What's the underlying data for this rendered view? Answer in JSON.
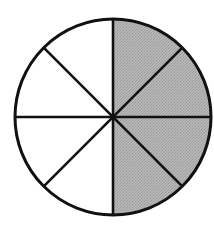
{
  "figure": {
    "title": "Fraction circle divided into eighths",
    "shape_name": "circle",
    "canvas": {
      "width": 214,
      "height": 227,
      "background_color": "#ffffff"
    }
  },
  "chart_data": {
    "type": "pie",
    "title": "",
    "subtitle": "",
    "xlabel": "",
    "ylabel": "",
    "legend_position": "none",
    "grid": false,
    "total_slices": 8,
    "slice_angle_degrees": 45,
    "shaded_slices": 4,
    "unshaded_slices": 4,
    "fraction_shaded": "4/8",
    "fraction_shaded_decimal": 0.5,
    "percent_shaded": 50,
    "categories": [
      "sector-1",
      "sector-2",
      "sector-3",
      "sector-4",
      "sector-5",
      "sector-6",
      "sector-7",
      "sector-8"
    ],
    "values": [
      45,
      45,
      45,
      45,
      45,
      45,
      45,
      45
    ],
    "series": [
      {
        "name": "shading",
        "values": [
          "shaded",
          "shaded",
          "shaded",
          "shaded",
          "unshaded",
          "unshaded",
          "unshaded",
          "unshaded"
        ]
      }
    ],
    "sectors": [
      {
        "id": "sector-1",
        "start_deg": -90,
        "end_deg": -45,
        "shaded": true,
        "position": "upper-right-upper"
      },
      {
        "id": "sector-2",
        "start_deg": -45,
        "end_deg": 0,
        "shaded": true,
        "position": "upper-right-lower"
      },
      {
        "id": "sector-3",
        "start_deg": 0,
        "end_deg": 45,
        "shaded": true,
        "position": "lower-right-upper"
      },
      {
        "id": "sector-4",
        "start_deg": 45,
        "end_deg": 90,
        "shaded": true,
        "position": "lower-right-lower"
      },
      {
        "id": "sector-5",
        "start_deg": 90,
        "end_deg": 135,
        "shaded": false,
        "position": "lower-left-lower"
      },
      {
        "id": "sector-6",
        "start_deg": 135,
        "end_deg": 180,
        "shaded": false,
        "position": "lower-left-upper"
      },
      {
        "id": "sector-7",
        "start_deg": 180,
        "end_deg": 225,
        "shaded": false,
        "position": "upper-left-lower"
      },
      {
        "id": "sector-8",
        "start_deg": 225,
        "end_deg": 270,
        "shaded": false,
        "position": "upper-left-upper"
      }
    ],
    "diameters": [
      {
        "id": "diameter-vertical",
        "angle_deg": 90,
        "label": "vertical"
      },
      {
        "id": "diameter-horizontal",
        "angle_deg": 0,
        "label": "horizontal"
      },
      {
        "id": "diameter-diagonal-nwse",
        "angle_deg": 45,
        "label": "diagonal-nw-se"
      },
      {
        "id": "diameter-diagonal-nesw",
        "angle_deg": 135,
        "label": "diagonal-ne-sw"
      }
    ]
  },
  "geometry": {
    "center_x": 113,
    "center_y": 117,
    "radius": 98,
    "stroke_width": 3,
    "divider_stroke_width": 2.6
  },
  "colors": {
    "shaded_fill": "#b2b2b2",
    "unshaded_fill": "#ffffff",
    "outline": "#111111",
    "divider": "#111111",
    "stipple_dot": "#8a8a8a",
    "background": "#ffffff"
  }
}
